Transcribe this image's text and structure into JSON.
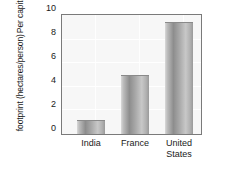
{
  "chart_data": {
    "type": "bar",
    "title": "",
    "xlabel": "",
    "ylabel_line1": "Per capita ecological",
    "ylabel_line2": "footprint (hectares/person)",
    "categories": [
      "India",
      "France",
      "United\nStates"
    ],
    "values": [
      1.2,
      5.0,
      9.4
    ],
    "ylim": [
      0,
      10
    ],
    "yticks": [
      10,
      8,
      6,
      4,
      2,
      0
    ],
    "ytick_labels": [
      "10",
      "8",
      "6",
      "4",
      "2",
      "0"
    ],
    "grid": true,
    "legend": "none",
    "bar_color": "#a0a0a0",
    "plot_background": "#f7f7f7",
    "axis_color": "#7a7a7a"
  },
  "labels": {
    "cat0": "India",
    "cat1": "France",
    "cat2": "United\nStates"
  },
  "ticks": {
    "t0": "10",
    "t1": "8",
    "t2": "6",
    "t3": "4",
    "t4": "2",
    "t5": "0"
  }
}
